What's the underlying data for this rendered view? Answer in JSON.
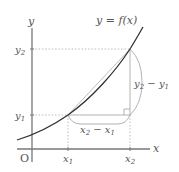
{
  "diagram": {
    "type": "function-graph-secant",
    "colors": {
      "axis": "#777777",
      "curve": "#333333",
      "secant": "#bbbbbb",
      "guide": "#aaaaaa",
      "label": "#555555",
      "background": "#ffffff"
    },
    "labels": {
      "y_axis": "y",
      "x_axis": "x",
      "origin": "O",
      "function": "y = f(x)",
      "x1": {
        "base": "x",
        "sub": "1"
      },
      "x2": {
        "base": "x",
        "sub": "2"
      },
      "y1": {
        "base": "y",
        "sub": "1"
      },
      "y2": {
        "base": "y",
        "sub": "2"
      },
      "dx": {
        "a": "x",
        "a_sub": "2",
        "op": " − ",
        "b": "x",
        "b_sub": "1"
      },
      "dy": {
        "a": "y",
        "a_sub": "2",
        "op": " − ",
        "b": "y",
        "b_sub": "1"
      }
    },
    "points": {
      "P1": {
        "name": "(x1, y1)"
      },
      "P2": {
        "name": "(x2, y2)"
      }
    },
    "annotations": [
      "right-angle-marker",
      "brace-dx",
      "brace-dy",
      "dotted-guides"
    ]
  }
}
